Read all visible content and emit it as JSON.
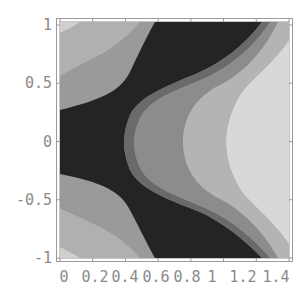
{
  "chart_data": {
    "type": "heatmap",
    "subtype": "contour",
    "title": "",
    "xlabel": "",
    "ylabel": "",
    "xlim": [
      0,
      1.4
    ],
    "ylim": [
      -1,
      1
    ],
    "x_ticks": [
      0,
      0.2,
      0.4,
      0.6,
      0.8,
      1,
      1.2,
      1.4
    ],
    "x_tick_labels": [
      "0",
      "0.2",
      "0.4",
      "0.6",
      "0.8",
      "1",
      "1.2",
      "1.4"
    ],
    "y_ticks": [
      -1,
      -0.5,
      0,
      0.5,
      1
    ],
    "y_tick_labels": [
      "-1",
      "-0.5",
      "0",
      "0.5",
      "1"
    ],
    "grid": false,
    "legend": "none",
    "levels": [
      {
        "name": "level-1",
        "color": "#242424",
        "description": "darkest band: left strip around y=0 branching to top and bottom edges"
      },
      {
        "name": "level-2",
        "color": "#6a6a6a",
        "description": "mid-dark band"
      },
      {
        "name": "level-3",
        "color": "#8c8c8c",
        "description": "middle band"
      },
      {
        "name": "level-4",
        "color": "#b4b4b4",
        "description": "light band"
      },
      {
        "name": "level-5",
        "color": "#d6d6d6",
        "description": "lightest band on right edge"
      },
      {
        "name": "level-6",
        "color": "#ececec",
        "description": "very light corners"
      }
    ],
    "regions": [
      {
        "level": "level-1",
        "points": [
          [
            0,
            0.3
          ],
          [
            0.35,
            0.3
          ],
          [
            0.5,
            0.6
          ],
          [
            0.6,
            1
          ],
          [
            1.3,
            1
          ],
          [
            1.1,
            0.78
          ],
          [
            0.6,
            0.5
          ],
          [
            0.43,
            0.2
          ],
          [
            0.43,
            -0.2
          ],
          [
            0.6,
            -0.5
          ],
          [
            1.1,
            -0.78
          ],
          [
            1.3,
            -1
          ],
          [
            0.6,
            -1
          ],
          [
            0.5,
            -0.6
          ],
          [
            0.35,
            -0.3
          ],
          [
            0,
            -0.3
          ]
        ]
      },
      {
        "level": "level-3",
        "points": [
          [
            0.43,
            0.2
          ],
          [
            0.6,
            0.5
          ],
          [
            1.1,
            0.78
          ],
          [
            0.95,
            0.4
          ],
          [
            0.85,
            0
          ],
          [
            0.95,
            -0.4
          ],
          [
            1.1,
            -0.78
          ],
          [
            0.6,
            -0.5
          ],
          [
            0.43,
            -0.2
          ]
        ]
      },
      {
        "level": "level-4",
        "points": [
          [
            0.85,
            0
          ],
          [
            0.95,
            0.4
          ],
          [
            1.1,
            0.78
          ],
          [
            1.3,
            1
          ],
          [
            1.36,
            1
          ],
          [
            1.17,
            0.6
          ],
          [
            1.05,
            0
          ],
          [
            1.17,
            -0.6
          ],
          [
            1.36,
            -1
          ],
          [
            1.3,
            -1
          ],
          [
            1.1,
            -0.78
          ],
          [
            0.95,
            -0.4
          ]
        ]
      },
      {
        "level": "level-5",
        "points": [
          [
            1.05,
            0
          ],
          [
            1.17,
            0.6
          ],
          [
            1.36,
            1
          ],
          [
            1.4,
            1
          ],
          [
            1.4,
            -1
          ],
          [
            1.36,
            -1
          ],
          [
            1.17,
            -0.6
          ]
        ]
      }
    ]
  }
}
